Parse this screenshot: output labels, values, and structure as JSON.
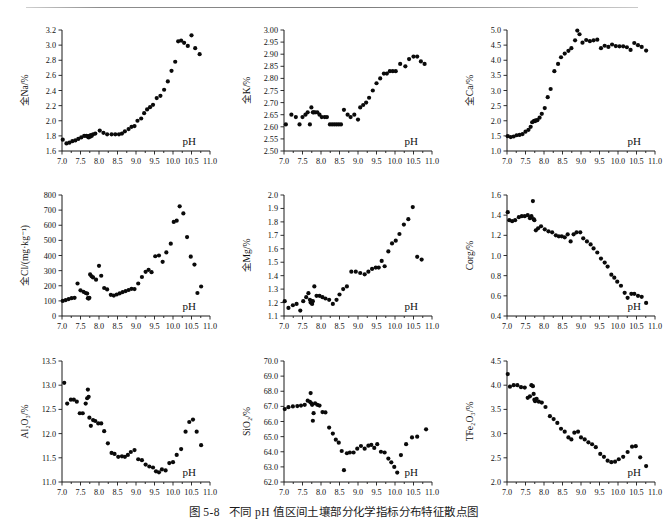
{
  "figure": {
    "caption_number": "图 5-8",
    "caption_text": "不同 pH 值区间土壤部分化学指标分布特征散点图",
    "x_axis_label": "pH",
    "x_ticks": [
      "7.0",
      "7.5",
      "8.0",
      "8.5",
      "9.0",
      "9.5",
      "10.0",
      "10.5",
      "11.0"
    ],
    "xlim": [
      7.0,
      11.0
    ],
    "marker_color": "#0a0a0a",
    "axis_color": "#1a1a1a",
    "background": "#ffffff"
  },
  "chart_data": [
    {
      "id": "na",
      "type": "scatter",
      "title": "",
      "xlabel": "pH",
      "ylabel": "全Na/%",
      "xlim": [
        7.0,
        11.0
      ],
      "ylim": [
        1.6,
        3.2
      ],
      "y_ticks": [
        "1.6",
        "1.8",
        "2.0",
        "2.2",
        "2.4",
        "2.6",
        "2.8",
        "3.0",
        "3.2"
      ],
      "grid": false,
      "x": [
        7.02,
        7.12,
        7.2,
        7.28,
        7.36,
        7.44,
        7.52,
        7.6,
        7.66,
        7.7,
        7.72,
        7.74,
        7.76,
        7.78,
        7.8,
        7.84,
        7.9,
        8.02,
        8.12,
        8.22,
        8.34,
        8.44,
        8.54,
        8.62,
        8.7,
        8.8,
        8.88,
        8.96,
        9.04,
        9.14,
        9.22,
        9.3,
        9.38,
        9.46,
        9.56,
        9.66,
        9.76,
        9.86,
        9.96,
        10.06,
        10.14,
        10.22,
        10.3,
        10.4,
        10.5,
        10.6,
        10.72
      ],
      "y": [
        1.75,
        1.7,
        1.71,
        1.73,
        1.74,
        1.76,
        1.78,
        1.8,
        1.8,
        1.79,
        1.78,
        1.8,
        1.79,
        1.81,
        1.8,
        1.82,
        1.83,
        1.87,
        1.84,
        1.82,
        1.82,
        1.82,
        1.82,
        1.83,
        1.86,
        1.89,
        1.92,
        1.93,
        2.0,
        2.03,
        2.1,
        2.15,
        2.18,
        2.21,
        2.3,
        2.33,
        2.41,
        2.52,
        2.66,
        2.78,
        3.05,
        3.06,
        3.03,
        2.99,
        3.13,
        2.96,
        2.88
      ]
    },
    {
      "id": "k",
      "type": "scatter",
      "title": "",
      "xlabel": "pH",
      "ylabel": "全K/%",
      "xlim": [
        7.0,
        11.0
      ],
      "ylim": [
        2.5,
        3.0
      ],
      "y_ticks": [
        "2.50",
        "2.55",
        "2.60",
        "2.65",
        "2.70",
        "2.75",
        "2.80",
        "2.85",
        "2.90",
        "2.95",
        "3.00"
      ],
      "grid": false,
      "x": [
        7.05,
        7.2,
        7.32,
        7.42,
        7.5,
        7.58,
        7.64,
        7.7,
        7.74,
        7.78,
        7.8,
        7.84,
        7.9,
        7.96,
        8.02,
        8.1,
        8.16,
        8.24,
        8.3,
        8.36,
        8.42,
        8.48,
        8.54,
        8.62,
        8.72,
        8.8,
        8.9,
        9.0,
        9.06,
        9.14,
        9.22,
        9.3,
        9.4,
        9.5,
        9.6,
        9.7,
        9.78,
        9.86,
        9.94,
        10.02,
        10.14,
        10.28,
        10.38,
        10.5,
        10.6,
        10.7,
        10.8
      ],
      "y": [
        2.61,
        2.65,
        2.64,
        2.61,
        2.64,
        2.65,
        2.66,
        2.61,
        2.68,
        2.66,
        2.66,
        2.66,
        2.66,
        2.65,
        2.64,
        2.64,
        2.64,
        2.61,
        2.61,
        2.61,
        2.61,
        2.61,
        2.61,
        2.67,
        2.65,
        2.64,
        2.65,
        2.63,
        2.68,
        2.69,
        2.7,
        2.72,
        2.75,
        2.78,
        2.8,
        2.82,
        2.82,
        2.83,
        2.83,
        2.83,
        2.86,
        2.85,
        2.88,
        2.89,
        2.89,
        2.87,
        2.86
      ]
    },
    {
      "id": "ca",
      "type": "scatter",
      "title": "",
      "xlabel": "pH",
      "ylabel": "全Ca/%",
      "xlim": [
        7.0,
        11.0
      ],
      "ylim": [
        1.0,
        5.0
      ],
      "y_ticks": [
        "1.0",
        "1.5",
        "2.0",
        "2.5",
        "3.0",
        "3.5",
        "4.0",
        "4.5",
        "5.0"
      ],
      "grid": false,
      "x": [
        7.02,
        7.1,
        7.18,
        7.26,
        7.34,
        7.42,
        7.5,
        7.58,
        7.64,
        7.68,
        7.72,
        7.74,
        7.76,
        7.78,
        7.82,
        7.88,
        7.94,
        8.02,
        8.1,
        8.18,
        8.28,
        8.38,
        8.46,
        8.56,
        8.66,
        8.74,
        8.84,
        8.9,
        8.96,
        9.04,
        9.14,
        9.24,
        9.34,
        9.44,
        9.54,
        9.64,
        9.74,
        9.84,
        9.94,
        10.04,
        10.14,
        10.24,
        10.34,
        10.44,
        10.54,
        10.64,
        10.76
      ],
      "y": [
        1.49,
        1.46,
        1.48,
        1.52,
        1.53,
        1.56,
        1.64,
        1.7,
        1.8,
        1.95,
        1.98,
        2.0,
        1.99,
        2.01,
        2.02,
        2.1,
        2.23,
        2.42,
        2.78,
        3.05,
        3.64,
        3.88,
        4.1,
        4.22,
        4.31,
        4.4,
        4.66,
        4.98,
        4.86,
        4.58,
        4.67,
        4.63,
        4.66,
        4.68,
        4.4,
        4.48,
        4.44,
        4.52,
        4.47,
        4.46,
        4.46,
        4.43,
        4.34,
        4.57,
        4.5,
        4.44,
        4.32
      ]
    },
    {
      "id": "cl",
      "type": "scatter",
      "title": "",
      "xlabel": "pH",
      "ylabel": "全Cl/(mg·kg⁻¹)",
      "xlim": [
        7.0,
        11.0
      ],
      "ylim": [
        0,
        800
      ],
      "y_ticks": [
        "0",
        "100",
        "200",
        "300",
        "400",
        "500",
        "600",
        "700",
        "800"
      ],
      "grid": false,
      "x": [
        7.02,
        7.1,
        7.18,
        7.26,
        7.34,
        7.42,
        7.5,
        7.58,
        7.64,
        7.68,
        7.7,
        7.72,
        7.74,
        7.76,
        7.8,
        7.84,
        7.92,
        8.0,
        8.06,
        8.14,
        8.22,
        8.32,
        8.4,
        8.48,
        8.56,
        8.64,
        8.72,
        8.8,
        8.88,
        8.96,
        9.06,
        9.16,
        9.26,
        9.34,
        9.42,
        9.52,
        9.62,
        9.72,
        9.82,
        9.94,
        10.02,
        10.1,
        10.18,
        10.28,
        10.38,
        10.48,
        10.58,
        10.66,
        10.76
      ],
      "y": [
        100,
        105,
        112,
        118,
        120,
        215,
        170,
        160,
        152,
        148,
        118,
        115,
        120,
        275,
        262,
        255,
        240,
        332,
        266,
        185,
        176,
        140,
        135,
        142,
        150,
        158,
        165,
        172,
        180,
        178,
        215,
        258,
        292,
        305,
        290,
        395,
        400,
        358,
        420,
        478,
        622,
        630,
        725,
        678,
        522,
        392,
        340,
        152,
        195
      ]
    },
    {
      "id": "mg",
      "type": "scatter",
      "title": "",
      "xlabel": "pH",
      "ylabel": "全Mg/%",
      "xlim": [
        7.0,
        11.0
      ],
      "ylim": [
        1.1,
        2.0
      ],
      "y_ticks": [
        "1.1",
        "1.2",
        "1.3",
        "1.4",
        "1.5",
        "1.6",
        "1.7",
        "1.8",
        "1.9",
        "2.0"
      ],
      "grid": false,
      "x": [
        7.02,
        7.12,
        7.24,
        7.34,
        7.44,
        7.52,
        7.6,
        7.66,
        7.7,
        7.72,
        7.74,
        7.76,
        7.78,
        7.82,
        7.88,
        7.96,
        8.04,
        8.12,
        8.22,
        8.32,
        8.42,
        8.5,
        8.6,
        8.7,
        8.82,
        8.94,
        9.06,
        9.18,
        9.28,
        9.38,
        9.48,
        9.56,
        9.64,
        9.72,
        9.82,
        9.92,
        10.02,
        10.12,
        10.24,
        10.36,
        10.48,
        10.6,
        10.72
      ],
      "y": [
        1.21,
        1.16,
        1.18,
        1.19,
        1.14,
        1.21,
        1.24,
        1.27,
        1.22,
        1.2,
        1.21,
        1.19,
        1.21,
        1.32,
        1.25,
        1.25,
        1.24,
        1.23,
        1.22,
        1.19,
        1.22,
        1.26,
        1.3,
        1.32,
        1.43,
        1.43,
        1.42,
        1.41,
        1.43,
        1.45,
        1.46,
        1.46,
        1.51,
        1.47,
        1.58,
        1.64,
        1.66,
        1.71,
        1.78,
        1.82,
        1.91,
        1.54,
        1.52
      ]
    },
    {
      "id": "corg",
      "type": "scatter",
      "title": "",
      "xlabel": "pH",
      "ylabel": "Corg/%",
      "xlim": [
        7.0,
        11.0
      ],
      "ylim": [
        0.4,
        1.6
      ],
      "y_ticks": [
        "0.4",
        "0.6",
        "0.8",
        "1.0",
        "1.2",
        "1.4",
        "1.6"
      ],
      "grid": false,
      "x": [
        7.02,
        7.06,
        7.14,
        7.22,
        7.32,
        7.4,
        7.48,
        7.56,
        7.62,
        7.66,
        7.7,
        7.72,
        7.74,
        7.78,
        7.84,
        7.92,
        8.02,
        8.12,
        8.22,
        8.32,
        8.4,
        8.48,
        8.56,
        8.64,
        8.72,
        8.8,
        8.88,
        8.98,
        9.06,
        9.16,
        9.26,
        9.34,
        9.44,
        9.54,
        9.64,
        9.72,
        9.82,
        9.9,
        9.98,
        10.08,
        10.18,
        10.26,
        10.36,
        10.44,
        10.54,
        10.64,
        10.76
      ],
      "y": [
        1.43,
        1.35,
        1.34,
        1.35,
        1.38,
        1.39,
        1.39,
        1.4,
        1.37,
        1.39,
        1.54,
        1.36,
        1.35,
        1.25,
        1.27,
        1.29,
        1.26,
        1.24,
        1.23,
        1.2,
        1.19,
        1.19,
        1.18,
        1.21,
        1.14,
        1.21,
        1.23,
        1.23,
        1.17,
        1.14,
        1.11,
        1.07,
        1.03,
        0.97,
        0.93,
        0.89,
        0.81,
        0.78,
        0.74,
        0.7,
        0.63,
        0.58,
        0.62,
        0.62,
        0.6,
        0.59,
        0.53
      ]
    },
    {
      "id": "al2o3",
      "type": "scatter",
      "title": "",
      "xlabel": "pH",
      "ylabel": "Al₂O₃/%",
      "xlim": [
        7.0,
        11.0
      ],
      "ylim": [
        11.0,
        13.5
      ],
      "y_ticks": [
        "11.0",
        "11.5",
        "12.0",
        "12.5",
        "13.0",
        "13.5"
      ],
      "grid": false,
      "x": [
        7.06,
        7.14,
        7.24,
        7.32,
        7.4,
        7.48,
        7.56,
        7.64,
        7.68,
        7.7,
        7.72,
        7.74,
        7.78,
        7.84,
        7.9,
        7.98,
        8.06,
        8.14,
        8.24,
        8.34,
        8.42,
        8.52,
        8.62,
        8.7,
        8.78,
        8.86,
        8.96,
        9.06,
        9.16,
        9.26,
        9.36,
        9.46,
        9.54,
        9.62,
        9.7,
        9.8,
        9.9,
        10.0,
        10.1,
        10.22,
        10.34,
        10.44,
        10.54,
        10.64,
        10.76
      ],
      "y": [
        13.05,
        12.62,
        12.7,
        12.7,
        12.66,
        12.42,
        12.42,
        12.62,
        12.73,
        12.91,
        12.76,
        12.33,
        12.16,
        12.28,
        12.26,
        12.21,
        12.21,
        12.05,
        11.8,
        11.6,
        11.58,
        11.52,
        11.53,
        11.52,
        11.56,
        11.62,
        11.66,
        11.47,
        11.45,
        11.36,
        11.32,
        11.3,
        11.22,
        11.2,
        11.26,
        11.24,
        11.39,
        11.41,
        11.56,
        11.68,
        12.04,
        12.24,
        12.29,
        12.04,
        11.76
      ]
    },
    {
      "id": "sio2",
      "type": "scatter",
      "title": "",
      "xlabel": "pH",
      "ylabel": "SiO₂/%",
      "xlim": [
        7.0,
        11.0
      ],
      "ylim": [
        62.0,
        70.0
      ],
      "y_ticks": [
        "62.0",
        "63.0",
        "64.0",
        "65.0",
        "66.0",
        "67.0",
        "68.0",
        "69.0",
        "70.0"
      ],
      "grid": false,
      "x": [
        7.02,
        7.12,
        7.24,
        7.36,
        7.46,
        7.56,
        7.64,
        7.7,
        7.72,
        7.74,
        7.76,
        7.78,
        7.8,
        7.84,
        7.9,
        7.96,
        8.04,
        8.12,
        8.22,
        8.32,
        8.4,
        8.48,
        8.56,
        8.62,
        8.7,
        8.78,
        8.88,
        8.98,
        9.08,
        9.18,
        9.28,
        9.36,
        9.44,
        9.52,
        9.62,
        9.72,
        9.82,
        9.9,
        9.98,
        10.06,
        10.16,
        10.3,
        10.46,
        10.6,
        10.84
      ],
      "y": [
        66.82,
        66.95,
        67.0,
        67.02,
        67.05,
        67.1,
        67.38,
        67.3,
        67.88,
        67.2,
        67.1,
        66.05,
        66.55,
        67.2,
        67.1,
        67.05,
        66.62,
        66.6,
        65.6,
        65.2,
        64.8,
        64.6,
        64.05,
        62.78,
        63.9,
        63.95,
        63.95,
        64.2,
        64.38,
        64.2,
        64.4,
        64.45,
        64.25,
        64.5,
        64.0,
        63.95,
        63.55,
        63.3,
        63.0,
        62.62,
        63.78,
        64.5,
        64.95,
        65.0,
        65.48
      ]
    },
    {
      "id": "tfe2o3",
      "type": "scatter",
      "title": "",
      "xlabel": "pH",
      "ylabel": "TFe₂O₃/%",
      "xlim": [
        7.0,
        11.0
      ],
      "ylim": [
        2.0,
        4.5
      ],
      "y_ticks": [
        "2.0",
        "2.5",
        "3.0",
        "3.5",
        "4.0",
        "4.5"
      ],
      "grid": false,
      "x": [
        7.02,
        7.08,
        7.18,
        7.28,
        7.38,
        7.48,
        7.56,
        7.62,
        7.66,
        7.7,
        7.72,
        7.74,
        7.76,
        7.8,
        7.86,
        7.94,
        8.04,
        8.16,
        8.26,
        8.36,
        8.46,
        8.56,
        8.66,
        8.74,
        8.82,
        8.92,
        9.0,
        9.1,
        9.2,
        9.3,
        9.4,
        9.52,
        9.62,
        9.72,
        9.82,
        9.92,
        10.02,
        10.14,
        10.26,
        10.38,
        10.48,
        10.6,
        10.76
      ],
      "y": [
        4.23,
        3.97,
        4.0,
        4.0,
        3.96,
        3.95,
        3.74,
        3.77,
        4.0,
        3.98,
        3.82,
        3.7,
        3.67,
        3.72,
        3.66,
        3.64,
        3.55,
        3.36,
        3.3,
        3.22,
        3.1,
        3.04,
        2.92,
        2.88,
        3.02,
        3.04,
        2.92,
        2.88,
        2.82,
        2.78,
        2.72,
        2.58,
        2.52,
        2.44,
        2.41,
        2.42,
        2.47,
        2.52,
        2.62,
        2.73,
        2.74,
        2.51,
        2.33
      ]
    }
  ]
}
